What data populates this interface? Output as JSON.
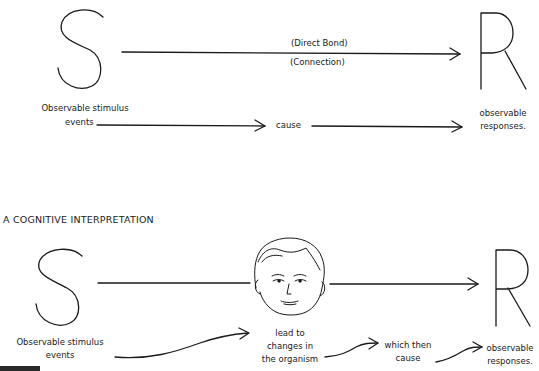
{
  "behaviorist": {
    "stimulus_letter": "S",
    "response_letter": "R",
    "bond_label_top": "(Direct Bond)",
    "bond_label_bottom": "(Connection)",
    "stimulus_label_line1": "Observable stimulus",
    "stimulus_label_line2": "events",
    "cause_label": "cause",
    "response_label_line1": "observable",
    "response_label_line2": "responses."
  },
  "cognitive": {
    "heading": "A COGNITIVE INTERPRETATION",
    "stimulus_letter": "S",
    "response_letter": "R",
    "organism_icon": "face-icon",
    "stimulus_label_line1": "Observable stimulus",
    "stimulus_label_line2": "events",
    "organism_label_line1": "lead to",
    "organism_label_line2": "changes in",
    "organism_label_line3": "the organism",
    "cause_label_line1": "which then",
    "cause_label_line2": "cause",
    "response_label_line1": "observable",
    "response_label_line2": "responses."
  }
}
